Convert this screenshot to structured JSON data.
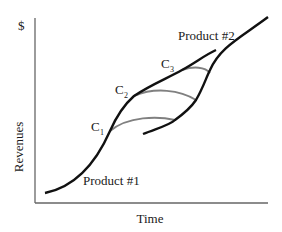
{
  "diagram": {
    "type": "s-curve-technology-substitution",
    "y_axis": {
      "unit_label": "$",
      "label": "Revenues"
    },
    "x_axis": {
      "label": "Time"
    },
    "curves": [
      {
        "name": "Product #1",
        "label": "Product #1",
        "color": "#111111"
      },
      {
        "name": "Product #2",
        "label": "Product #2",
        "color": "#111111"
      }
    ],
    "connectors": [
      {
        "label": "C",
        "subscript": "1",
        "color": "#777777"
      },
      {
        "label": "C",
        "subscript": "2",
        "color": "#777777"
      },
      {
        "label": "C",
        "subscript": "3",
        "color": "#777777"
      }
    ],
    "colors": {
      "axis": "#555555",
      "curve": "#111111",
      "connector": "#808080"
    }
  }
}
